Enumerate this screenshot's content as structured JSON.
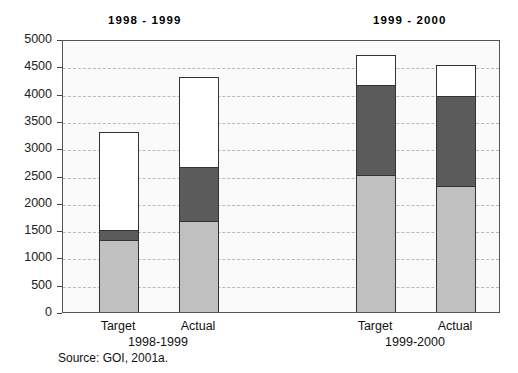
{
  "chart_data": {
    "type": "bar",
    "title": "",
    "subtitle": "",
    "xlabel": "",
    "ylabel": "",
    "ylim": [
      0,
      5000
    ],
    "yticks": [
      0,
      500,
      1000,
      1500,
      2000,
      2500,
      3000,
      3500,
      4000,
      4500,
      5000
    ],
    "ytick_labels": [
      "0",
      "500",
      "1000",
      "1500",
      "2000",
      "2500",
      "3000",
      "3500",
      "4000",
      "4500",
      "5000"
    ],
    "grid": true,
    "stacked": true,
    "legend": "none",
    "group_titles": [
      "1998 - 1999",
      "1999 - 2000"
    ],
    "group_labels": [
      "1998-1999",
      "1999-2000"
    ],
    "categories": [
      "Target",
      "Actual",
      "Target",
      "Actual"
    ],
    "series": [
      {
        "name": "light-gray-segment",
        "color": "#c0c0c0",
        "values": [
          1300,
          1650,
          2500,
          2300
        ]
      },
      {
        "name": "dark-gray-segment",
        "color": "#5b5b5b",
        "values": [
          200,
          1000,
          1650,
          1650
        ]
      },
      {
        "name": "white-segment",
        "color": "#ffffff",
        "values": [
          1800,
          1650,
          550,
          570
        ]
      }
    ],
    "totals": [
      3300,
      4300,
      4700,
      4520
    ],
    "source_note": "Source: GOI, 2001a."
  },
  "colors": {
    "light": "#c0c0c0",
    "dark": "#5b5b5b",
    "white": "#ffffff",
    "axis": "#555555",
    "grid": "#b9b9b9",
    "plot_bg": "#fafafa"
  }
}
